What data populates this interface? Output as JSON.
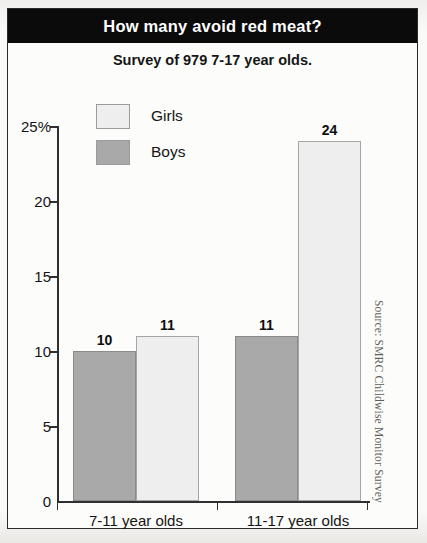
{
  "header": {
    "title": "How many avoid red meat?",
    "subtitle": "Survey of 979 7-17 year olds."
  },
  "legend": {
    "items": [
      {
        "label": "Girls",
        "color": "#eeeeee",
        "swatch_name": "legend-swatch-girls"
      },
      {
        "label": "Boys",
        "color": "#a9a9a9",
        "swatch_name": "legend-swatch-boys"
      }
    ]
  },
  "source_note": "Source: SMRC Childwise Monitor Survey",
  "axis": {
    "y_ticks": [
      {
        "value": 25,
        "label": "25%"
      },
      {
        "value": 20,
        "label": "20"
      },
      {
        "value": 15,
        "label": "15"
      },
      {
        "value": 10,
        "label": "10"
      },
      {
        "value": 5,
        "label": "5"
      },
      {
        "value": 0,
        "label": "0"
      }
    ]
  },
  "colors": {
    "banner_bg": "#0b0b0b",
    "banner_text": "#ffffff",
    "girls": "#eeeeee",
    "boys": "#a9a9a9",
    "axis": "#2f2f2f",
    "panel_bg": "#fcfcfb"
  },
  "chart_data": {
    "type": "bar",
    "title": "How many avoid red meat?",
    "subtitle": "Survey of 979 7-17 year olds.",
    "xlabel": "",
    "ylabel": "",
    "ylim": [
      0,
      25
    ],
    "ytick_values": [
      0,
      5,
      10,
      15,
      20,
      25
    ],
    "ytick_labels": [
      "0",
      "5",
      "10",
      "15",
      "20",
      "25%"
    ],
    "grid": false,
    "legend_position": "upper-left-inside",
    "value_labels": true,
    "units": "percent",
    "categories": [
      "7-11 year olds",
      "11-17 year olds"
    ],
    "series": [
      {
        "name": "Boys",
        "color": "#a9a9a9",
        "values": [
          10,
          11
        ]
      },
      {
        "name": "Girls",
        "color": "#eeeeee",
        "values": [
          11,
          24
        ]
      }
    ],
    "annotations": [
      "Source: SMRC Childwise Monitor Survey"
    ]
  }
}
